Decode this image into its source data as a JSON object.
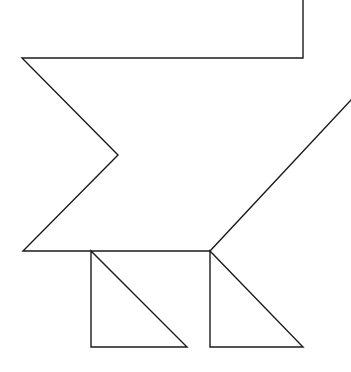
{
  "figure": {
    "description": "Black outline line drawing of a zigzag arrow-like polygon with two right triangles beneath it",
    "background_color": "#ffffff",
    "stroke_color": "#1b1b1b",
    "stroke_width": 1.4,
    "canvas": {
      "width": 351,
      "height": 372
    },
    "shapes": [
      {
        "name": "zigzag-arrow-outline",
        "type": "polyline",
        "closed": false,
        "points": [
          [
            303,
            0
          ],
          [
            303,
            58
          ],
          [
            22,
            58
          ],
          [
            118,
            155
          ],
          [
            23,
            251
          ],
          [
            210,
            251
          ],
          [
            351,
            100
          ]
        ]
      },
      {
        "name": "left-right-triangle",
        "type": "polyline",
        "closed": true,
        "points": [
          [
            91,
            251
          ],
          [
            91,
            347
          ],
          [
            187,
            347
          ]
        ]
      },
      {
        "name": "right-right-triangle",
        "type": "polyline",
        "closed": true,
        "points": [
          [
            210,
            251
          ],
          [
            210,
            347
          ],
          [
            303,
            347
          ]
        ]
      }
    ]
  }
}
